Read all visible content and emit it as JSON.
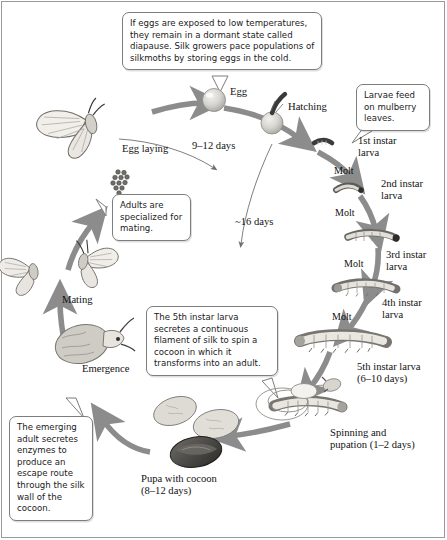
{
  "figure": {
    "colors": {
      "arrow_gray": "#8c8c8c",
      "thin_arc": "#6f6f6f",
      "callout_border": "#7d7d7d",
      "frame_border": "#9a9a9a",
      "body_fill": "#e8e6e2",
      "dark_cocoon": "#3a3a3a",
      "text": "#1a1a1a"
    }
  },
  "callouts": [
    {
      "id": "egg-diapause",
      "text": "If eggs are exposed to low temperatures, they remain in a dormant state called diapause. Silk growers pace populations of silkmoths by storing eggs in the cold."
    },
    {
      "id": "larvae-feeding",
      "text": "Larvae feed on mulberry leaves."
    },
    {
      "id": "adults-mating",
      "text": "Adults are specialized for mating."
    },
    {
      "id": "fifth-instar-silk",
      "text": "The 5th instar larva secretes a continuous filament of silk to spin a cocoon in which it transforms into an adult."
    },
    {
      "id": "emerging-adult-enzymes",
      "text": "The emerging adult secretes enzymes to produce an escape route through the silk wall of the cocoon."
    }
  ],
  "stage_labels": {
    "egg": "Egg",
    "hatching": "Hatching",
    "first_instar": "1st instar\nlarva",
    "second_instar": "2nd instar\nlarva",
    "third_instar": "3rd instar\nlarva",
    "fourth_instar": "4th instar\nlarva",
    "fifth_instar": "5th instar larva\n(6–10 days)",
    "spinning": "Spinning and\npupation (1–2 days)",
    "pupa": "Pupa with cocoon\n(8–12 days)",
    "emergence": "Emergence",
    "mating": "Mating",
    "egg_laying": "Egg laying"
  },
  "molt_labels": {
    "molt_1": "Molt",
    "molt_2": "Molt",
    "molt_3": "Molt",
    "molt_4": "Molt"
  },
  "duration_labels": {
    "egg_stage": "9–12 days",
    "larval_stage": "~16 days"
  }
}
